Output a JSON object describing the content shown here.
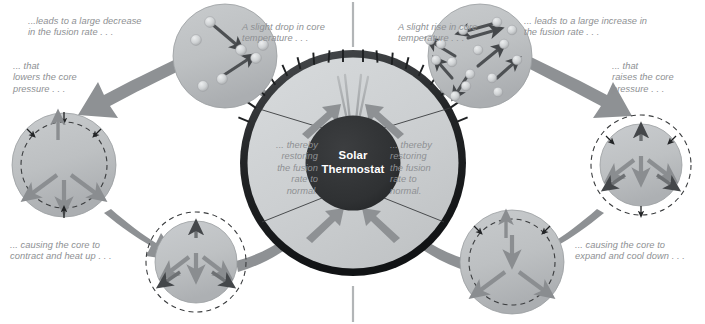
{
  "diagram": {
    "title": "Solar Thermostat",
    "center": {
      "label": "Solar\nThermostat",
      "line1": "Solar",
      "line2": "Thermostat"
    },
    "colors": {
      "background": "#ffffff",
      "circle_fill": "#b9bcbe",
      "circle_fill_light": "#c3c6c8",
      "dial_face": "#cdd0d2",
      "dial_rim": "#2f3133",
      "core": "#303234",
      "arrow_gray": "#8d9093",
      "arrow_dark": "#4f5255",
      "text_gray": "#8e9093",
      "tick": "#1d1f21",
      "needle": "#9a9da0",
      "particle": "#d9dbdd",
      "divider": "#b3b6b8"
    },
    "labels": {
      "top_left": "...leads to a large decrease\nin the fusion rate . . .",
      "left_upper": "... that\nlowers the core\npressure . . .",
      "bottom_left": "... causing the core to\ncontract and heat up . . .",
      "top_center_left": "A slight drop in core\ntemperature . . .",
      "top_center_right": "A slight rise in core\ntemperature . . .",
      "top_right": "... leads to a large increase in\nthe fusion rate . . .",
      "right_upper": "... that\nraises the core\npressure . . .",
      "bottom_right": "... causing the core to\nexpand and cool down . . .",
      "dial_left": "... thereby\nrestoring\nthe fusion\nrate to\nnormal.",
      "dial_right": "... thereby\nrestoring\nthe fusion\nrate to\nnormal."
    },
    "nodes": {
      "fusion_low": {
        "name": "low-fusion-rate-core",
        "cx": 225,
        "cy": 56,
        "r": 52,
        "description": "sparse particles with few fusion arrows"
      },
      "pressure_low": {
        "name": "low-pressure-expanding-core",
        "cx": 64,
        "cy": 165,
        "r": 52,
        "description": "solid outer circle, dashed inner circle, outward arrows"
      },
      "contract": {
        "name": "contracting-core",
        "cx": 196,
        "cy": 262,
        "r": 42,
        "description": "solid inner circle, dashed outer circle, inward arrows"
      },
      "fusion_high": {
        "name": "high-fusion-rate-core",
        "cx": 480,
        "cy": 56,
        "r": 52,
        "description": "dense particles with many fusion arrows"
      },
      "pressure_high": {
        "name": "high-pressure-contracting-core",
        "cx": 641,
        "cy": 165,
        "r": 42,
        "description": "solid inner circle, dashed outer circle, inward arrows"
      },
      "expand": {
        "name": "expanding-core",
        "cx": 512,
        "cy": 262,
        "r": 52,
        "description": "solid outer circle, dashed inner circle, outward arrows"
      },
      "thermostat": {
        "name": "solar-thermostat-dial",
        "cx": 353,
        "cy": 163,
        "r": 113,
        "core_r": 47,
        "ticks": 17
      }
    },
    "flow": {
      "left_cycle": [
        "fusion_low",
        "pressure_low",
        "contract",
        "thermostat"
      ],
      "right_cycle": [
        "thermostat",
        "fusion_high",
        "pressure_high",
        "expand"
      ]
    }
  }
}
